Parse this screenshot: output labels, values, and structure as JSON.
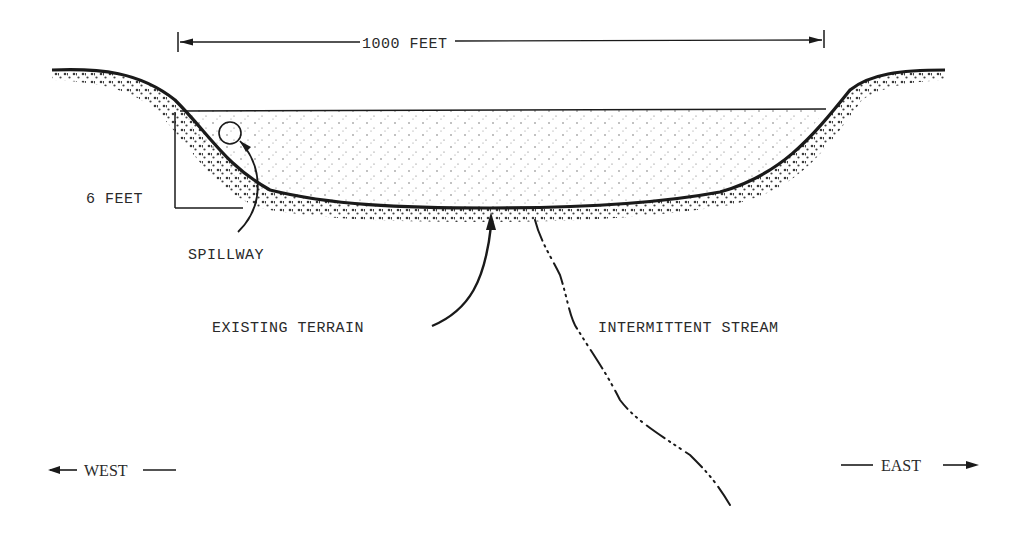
{
  "figure": {
    "type": "cross-section"
  },
  "dimensions": {
    "width_label": "1000 FEET",
    "depth_label": "6 FEET"
  },
  "labels": {
    "spillway": "SPILLWAY",
    "existing_terrain": "EXISTING TERRAIN",
    "intermittent_stream": "INTERMITTENT STREAM"
  },
  "orientation": {
    "west": "WEST",
    "east": "EAST"
  },
  "colors": {
    "ink": "#1a1a1a",
    "text": "#2a2a2a",
    "paper": "#ffffff"
  }
}
